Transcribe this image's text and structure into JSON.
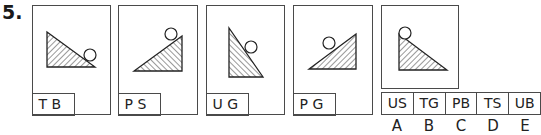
{
  "question_number": "5.",
  "panels": [
    {
      "label": "T B",
      "triangle": [
        [
          14,
          26
        ],
        [
          14,
          61
        ],
        [
          62,
          61
        ]
      ],
      "hatch": "back",
      "circle": {
        "cx": 57,
        "cy": 49,
        "r": 6
      }
    },
    {
      "label": "P S",
      "triangle": [
        [
          15,
          65
        ],
        [
          63,
          65
        ],
        [
          63,
          30
        ]
      ],
      "hatch": "fwd",
      "circle": {
        "cx": 52,
        "cy": 28,
        "r": 6
      }
    },
    {
      "label": "U G",
      "triangle": [
        [
          22,
          22
        ],
        [
          22,
          71
        ],
        [
          56,
          71
        ]
      ],
      "hatch": "fwd",
      "circle": {
        "cx": 44,
        "cy": 41,
        "r": 6
      }
    },
    {
      "label": "P G",
      "triangle": [
        [
          15,
          63
        ],
        [
          62,
          63
        ],
        [
          62,
          28
        ]
      ],
      "hatch": "back",
      "circle": {
        "cx": 35,
        "cy": 37,
        "r": 6
      }
    }
  ],
  "target_panel": {
    "triangle": [
      [
        17,
        28
      ],
      [
        17,
        64
      ],
      [
        65,
        64
      ]
    ],
    "hatch": "back",
    "circle": {
      "cx": 23,
      "cy": 27,
      "r": 6
    }
  },
  "answers": [
    {
      "code": "US",
      "letter": "A"
    },
    {
      "code": "TG",
      "letter": "B"
    },
    {
      "code": "PB",
      "letter": "C"
    },
    {
      "code": "TS",
      "letter": "D"
    },
    {
      "code": "UB",
      "letter": "E"
    }
  ]
}
